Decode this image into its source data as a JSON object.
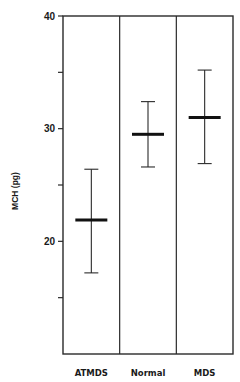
{
  "chart_data": {
    "type": "errorbar",
    "title": "",
    "xlabel": "",
    "ylabel": "MCH (pg)",
    "ylim": [
      10,
      40
    ],
    "yticks_major": [
      20,
      30,
      40
    ],
    "yticks_minor": [
      15,
      25,
      35
    ],
    "ytick_labels": [
      "20",
      "30",
      "40"
    ],
    "grid": false,
    "legend": null,
    "categories": [
      "ATMDS",
      "Normal",
      "MDS"
    ],
    "series": [
      {
        "name": "MCH",
        "mean": [
          21.9,
          29.5,
          31.0
        ],
        "upper": [
          26.4,
          32.4,
          35.2
        ],
        "lower": [
          17.2,
          26.6,
          26.9
        ]
      }
    ]
  }
}
